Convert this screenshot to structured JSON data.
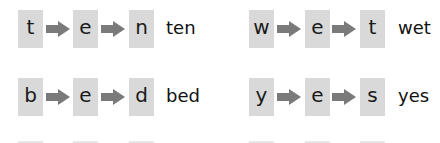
{
  "colors": {
    "box_fill": "#d9d9d9",
    "arrow_fill": "#7a7a7a",
    "text": "#111111",
    "background": "#ffffff"
  },
  "icons": {
    "arrow": "right-arrow-icon"
  },
  "words": [
    {
      "letters": [
        "t",
        "e",
        "n"
      ],
      "word": "ten"
    },
    {
      "letters": [
        "w",
        "e",
        "t"
      ],
      "word": "wet"
    },
    {
      "letters": [
        "b",
        "e",
        "d"
      ],
      "word": "bed"
    },
    {
      "letters": [
        "y",
        "e",
        "s"
      ],
      "word": "yes"
    }
  ]
}
